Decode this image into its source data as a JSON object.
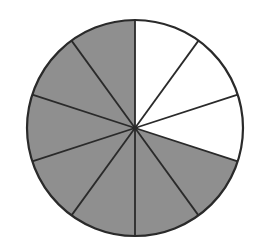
{
  "chart_data": {
    "type": "pie",
    "title": "",
    "total_parts": 10,
    "shaded_parts": 7,
    "unshaded_parts": 3,
    "slices": [
      {
        "index": 0,
        "value": 1,
        "shaded": false
      },
      {
        "index": 1,
        "value": 1,
        "shaded": false
      },
      {
        "index": 2,
        "value": 1,
        "shaded": false
      },
      {
        "index": 3,
        "value": 1,
        "shaded": true
      },
      {
        "index": 4,
        "value": 1,
        "shaded": true
      },
      {
        "index": 5,
        "value": 1,
        "shaded": true
      },
      {
        "index": 6,
        "value": 1,
        "shaded": true
      },
      {
        "index": 7,
        "value": 1,
        "shaded": true
      },
      {
        "index": 8,
        "value": 1,
        "shaded": true
      },
      {
        "index": 9,
        "value": 1,
        "shaded": true
      }
    ],
    "start_angle_deg": 0,
    "direction": "clockwise",
    "legend": null
  },
  "style": {
    "shaded_color": "#8f8f8f",
    "unshaded_color": "#ffffff",
    "line_color": "#2a2a2a",
    "line_width": 1.8,
    "center_x": 135,
    "center_y": 128,
    "radius": 108
  }
}
